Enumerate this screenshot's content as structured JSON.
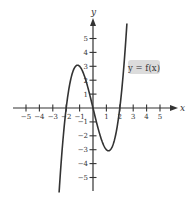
{
  "chart_data": {
    "type": "line",
    "title": "",
    "xlabel": "x",
    "ylabel": "y",
    "xlim": [
      -5,
      5
    ],
    "ylim": [
      -5,
      5
    ],
    "xticks": [
      -5,
      -4,
      -3,
      -2,
      -1,
      1,
      2,
      3,
      4,
      5
    ],
    "yticks": [
      -5,
      -4,
      -3,
      -2,
      -1,
      1,
      2,
      3,
      4,
      5
    ],
    "grid": false,
    "legend": null,
    "annotations": [
      {
        "text": "y = f(x)",
        "near": [
          2.9,
          3.0
        ],
        "style": "gray rounded box"
      }
    ],
    "series": [
      {
        "name": "y = f(x)",
        "description": "cubic curve, local max ≈ 3 near x ≈ -1.15, local min ≈ -3 near x ≈ 1.15, zeros at x = -2, 0, 2",
        "x_range": [
          -2.53,
          2.53
        ],
        "formula": "x^3 - 4x",
        "points": [
          [
            -2.53,
            -6.1
          ],
          [
            -2.4,
            -4.2
          ],
          [
            -2.2,
            -1.85
          ],
          [
            -2.0,
            0.0
          ],
          [
            -1.8,
            1.37
          ],
          [
            -1.6,
            2.3
          ],
          [
            -1.4,
            2.86
          ],
          [
            -1.155,
            3.08
          ],
          [
            -1.0,
            3.0
          ],
          [
            -0.8,
            2.69
          ],
          [
            -0.6,
            2.18
          ],
          [
            -0.4,
            1.54
          ],
          [
            -0.2,
            0.79
          ],
          [
            0.0,
            0.0
          ],
          [
            0.2,
            -0.79
          ],
          [
            0.4,
            -1.54
          ],
          [
            0.6,
            -2.18
          ],
          [
            0.8,
            -2.69
          ],
          [
            1.0,
            -3.0
          ],
          [
            1.155,
            -3.08
          ],
          [
            1.4,
            -2.86
          ],
          [
            1.6,
            -2.3
          ],
          [
            1.8,
            -1.37
          ],
          [
            2.0,
            0.0
          ],
          [
            2.2,
            1.85
          ],
          [
            2.4,
            4.2
          ],
          [
            2.53,
            6.1
          ]
        ]
      }
    ]
  },
  "colors": {
    "axis": "#333333",
    "curve": "#333333",
    "label_box": "#dcdcdc",
    "background": "#ffffff"
  }
}
